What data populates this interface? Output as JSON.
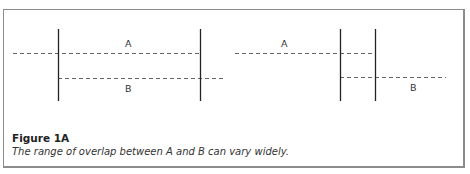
{
  "figure": {
    "title": "Figure 1A",
    "caption": "The range of overlap between A and B can vary widely."
  },
  "panels": [
    {
      "name": "wide-overlap",
      "labels": {
        "a": "A",
        "b": "B"
      }
    },
    {
      "name": "narrow-overlap",
      "labels": {
        "a": "A",
        "b": "B"
      }
    }
  ],
  "colors": {
    "border": "#8c8c8c",
    "dashed_line": "#666666",
    "solid_line": "#222222",
    "text": "#333333"
  }
}
